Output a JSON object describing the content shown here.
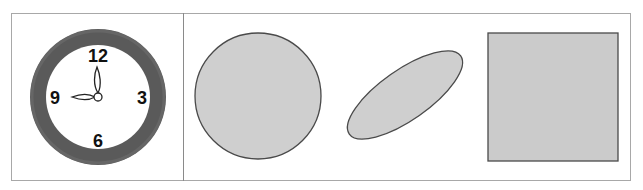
{
  "figure": {
    "panels": [
      {
        "id": "clock-panel",
        "clock": {
          "numbers": [
            "12",
            "3",
            "6",
            "9"
          ],
          "time_shown": "9:00",
          "colors": {
            "rim": "#5a5a5a",
            "face": "#ffffff",
            "hands_fill": "#ffffff",
            "hands_stroke": "#222222"
          }
        }
      },
      {
        "id": "shapes-panel",
        "shapes": [
          {
            "type": "circle",
            "fill": "#cfcfcf",
            "stroke": "#4a4a4a"
          },
          {
            "type": "ellipse",
            "fill": "#cfcfcf",
            "stroke": "#4a4a4a",
            "rotation_deg": -35
          },
          {
            "type": "square",
            "fill": "#cbcbcb",
            "stroke": "#4a4a4a"
          }
        ]
      }
    ],
    "colors": {
      "frame_border": "#a8a8a8",
      "divider": "#8a8a8a"
    }
  }
}
